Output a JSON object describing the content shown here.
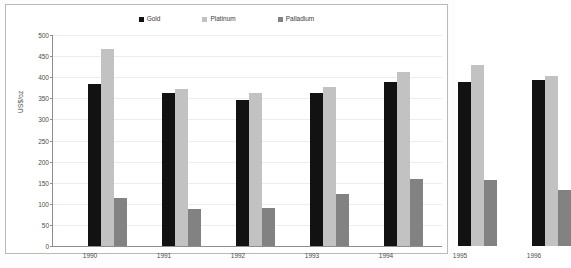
{
  "chart_data": {
    "type": "bar",
    "title": "",
    "xlabel": "",
    "ylabel": "US$/oz",
    "ylim": [
      0,
      500
    ],
    "ytick_step": 50,
    "grid": true,
    "legend_position": "top-center",
    "categories": [
      "1990",
      "1991",
      "1992",
      "1993",
      "1994",
      "1995",
      "1996"
    ],
    "yticks": [
      "0",
      "50",
      "100",
      "150",
      "200",
      "250",
      "300",
      "350",
      "400",
      "450",
      "500"
    ],
    "series": [
      {
        "name": "Gold",
        "color": "#121212",
        "values": [
          385,
          363,
          345,
          362,
          388,
          388,
          393
        ]
      },
      {
        "name": "Platinum",
        "color": "#c2c2c2",
        "values": [
          468,
          371,
          362,
          377,
          413,
          429,
          402
        ]
      },
      {
        "name": "Palladium",
        "color": "#828282",
        "values": [
          114,
          88,
          90,
          124,
          158,
          156,
          133
        ]
      }
    ]
  }
}
